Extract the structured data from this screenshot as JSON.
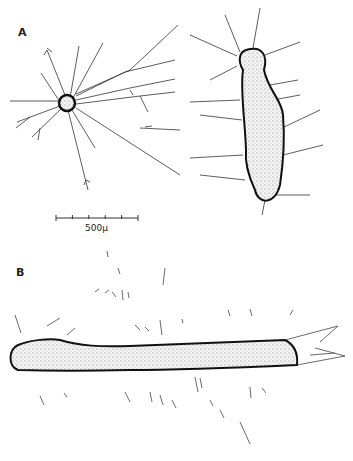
{
  "figure": {
    "panels": [
      {
        "label": "A",
        "description": "Neuron-like cell with radiating branching processes and elongated cell body with lateral branching processes"
      },
      {
        "label": "B",
        "description": "Elongated tubular body with surrounding short strokes and a split forked tip on the right"
      }
    ],
    "scale_bar": {
      "label": "500μ",
      "ticks": 6
    }
  }
}
